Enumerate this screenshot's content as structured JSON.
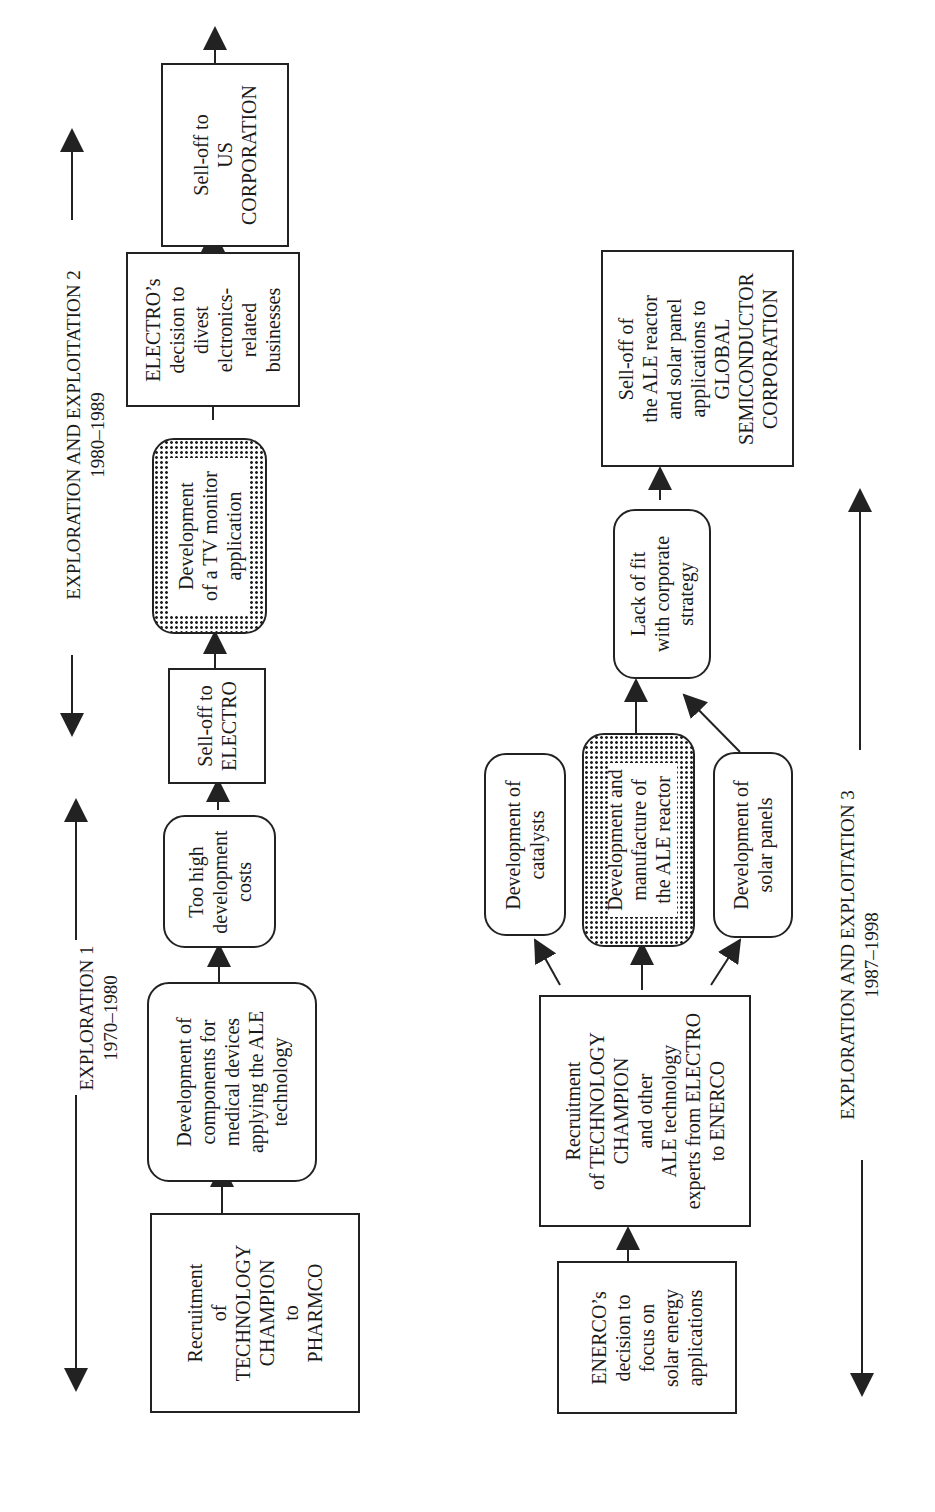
{
  "diagram": {
    "top_flow": {
      "phases": [
        {
          "name": "EXPLORATION 1",
          "years": "1970–1980"
        },
        {
          "name": "EXPLORATION AND EXPLOITATION 2",
          "years": "1980–1989"
        }
      ],
      "nodes": [
        {
          "id": "recruit-pharmco",
          "shape": "rect",
          "lines": [
            "Recruitment",
            "of",
            "TECHNOLOGY",
            "CHAMPION",
            "to",
            "PHARMCO"
          ]
        },
        {
          "id": "dev-medical",
          "shape": "rounded",
          "lines": [
            "Development of",
            "components for",
            "medical devices",
            "applying the ALE",
            "technology"
          ]
        },
        {
          "id": "high-costs",
          "shape": "rounded",
          "lines": [
            "Too high",
            "development",
            "costs"
          ]
        },
        {
          "id": "selloff-electro",
          "shape": "rect",
          "lines": [
            "Sell-off to",
            "ELECTRO"
          ]
        },
        {
          "id": "dev-tv",
          "shape": "shaded-rounded",
          "lines": [
            "Development",
            "of a TV monitor",
            "application"
          ]
        },
        {
          "id": "electro-divest",
          "shape": "rect",
          "lines": [
            "ELECTRO’s",
            "decision to",
            "divest",
            "elctronics-",
            "related",
            "businesses"
          ]
        },
        {
          "id": "selloff-us",
          "shape": "rect",
          "lines": [
            "Sell-off to",
            "US",
            "CORPORATION"
          ]
        }
      ]
    },
    "bottom_flow": {
      "phases": [
        {
          "name": "EXPLORATION AND EXPLOITATION 3",
          "years": "1987–1998"
        }
      ],
      "nodes": [
        {
          "id": "enerco-decision",
          "shape": "rect",
          "lines": [
            "ENERCO’s",
            "decision to",
            "focus on",
            "solar energy",
            "applications"
          ]
        },
        {
          "id": "recruit-enerco",
          "shape": "rect",
          "lines": [
            "Recruitment",
            "of  TECHNOLOGY",
            "CHAMPION",
            "and other",
            "ALE technology",
            "experts from ELECTRO",
            "to  ENERCO"
          ]
        },
        {
          "id": "dev-catalysts",
          "shape": "rounded",
          "lines": [
            "Development of",
            "catalysts"
          ]
        },
        {
          "id": "dev-reactor",
          "shape": "shaded-rounded",
          "lines": [
            "Development and",
            "manufacture of",
            "the ALE reactor"
          ]
        },
        {
          "id": "dev-solar",
          "shape": "rounded",
          "lines": [
            "Development of",
            "solar panels"
          ]
        },
        {
          "id": "lack-fit",
          "shape": "rounded",
          "lines": [
            "Lack of fit",
            "with corporate",
            "strategy"
          ]
        },
        {
          "id": "selloff-global",
          "shape": "rect",
          "lines": [
            "Sell-off of",
            "the ALE reactor",
            "and solar panel",
            "applications to",
            "GLOBAL",
            "SEMICONDUCTOR",
            "CORPORATION"
          ]
        }
      ]
    },
    "colors": {
      "line": "#222222",
      "background": "#ffffff",
      "shade_dots": "#222222"
    }
  }
}
